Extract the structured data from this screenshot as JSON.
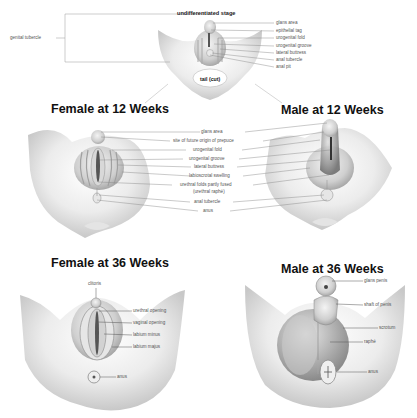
{
  "panels": {
    "undifferentiated": {
      "title": "undifferentiated stage",
      "left_label": "genital tubercle",
      "center_label": "tail (cut)",
      "labels": [
        "glans area",
        "epithelial tag",
        "urogenital fold",
        "urogenital groove",
        "lateral buttress",
        "anal tubercle",
        "anal pit"
      ]
    },
    "female12": {
      "title": "Female at 12 Weeks"
    },
    "male12": {
      "title": "Male at 12 Weeks"
    },
    "shared12": {
      "labels": [
        "glans area",
        "site of future origin of prepuce",
        "urogenital fold",
        "urogenital groove",
        "lateral buttress",
        "labioscrotal swelling",
        "urethral folds partly fused",
        "(urethral raphé)",
        "anal tubercle",
        "anus"
      ]
    },
    "female36": {
      "title": "Female at 36 Weeks",
      "labels": [
        "clitoris",
        "urethral opening",
        "vaginal opening",
        "labium minus",
        "labium majus",
        "anus"
      ]
    },
    "male36": {
      "title": "Male at 36 Weeks",
      "labels": [
        "glans penis",
        "shaft of penis",
        "scrotum",
        "raphé",
        "anus"
      ]
    }
  },
  "colors": {
    "tissue_light": "#f2f2f2",
    "tissue_mid": "#c9c9c9",
    "tissue_dark": "#8a8a8a",
    "line": "#777777",
    "text": "#555555",
    "title": "#111111"
  }
}
